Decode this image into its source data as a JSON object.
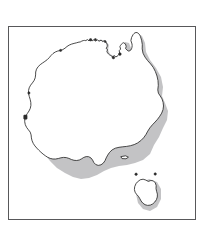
{
  "figure": {
    "type": "outline-map",
    "background_color": "#ffffff",
    "frame": {
      "visible": true,
      "border_color": "#58585a",
      "border_width_px": 1,
      "left_px": 8,
      "top_px": 26,
      "width_px": 188,
      "height_px": 194
    },
    "style": {
      "coast_stroke_color": "#2b2b2b",
      "coast_fill_color": "#ffffff",
      "island_marker_color": "#2b2b2b",
      "drop_shadow_color": "#b9b9bb",
      "stroke_width_px": 0.85
    },
    "labels": [],
    "legend": [],
    "title": "",
    "caption": "",
    "landmasses": [
      {
        "name": "mainland-australia",
        "kind": "continent"
      },
      {
        "name": "tasmania",
        "kind": "island"
      }
    ],
    "coastline_features": [
      "cape-york-peninsula",
      "gulf-of-carpentaria",
      "arnhem-land",
      "top-end",
      "kimberley-coast",
      "north-west-cape",
      "shark-bay",
      "south-west-cape",
      "great-australian-bight",
      "eyre-peninsula",
      "yorke-peninsula",
      "spencer-gulf",
      "gulf-st-vincent",
      "bass-strait",
      "east-coast-queensland",
      "new-south-wales-coast"
    ],
    "view": {
      "svg_width": 186,
      "svg_height": 192
    }
  }
}
